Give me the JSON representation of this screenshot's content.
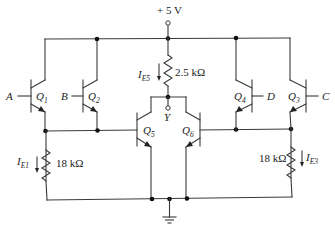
{
  "figure": {
    "type": "circuit-schematic",
    "supply": {
      "label": "+ 5 V"
    },
    "resistors": [
      {
        "id": "R_E5",
        "value": "2.5 kΩ",
        "current_label": "I",
        "current_sub": "E5"
      },
      {
        "id": "R_E1",
        "value": "18 kΩ",
        "current_label": "I",
        "current_sub": "E1"
      },
      {
        "id": "R_E3",
        "value": "18 kΩ",
        "current_label": "I",
        "current_sub": "E3"
      }
    ],
    "transistors": [
      {
        "id": "Q1",
        "name": "Q",
        "sub": "1",
        "input": "A"
      },
      {
        "id": "Q2",
        "name": "Q",
        "sub": "2",
        "input": "B"
      },
      {
        "id": "Q3",
        "name": "Q",
        "sub": "3",
        "input": "C"
      },
      {
        "id": "Q4",
        "name": "Q",
        "sub": "4",
        "input": "D"
      },
      {
        "id": "Q5",
        "name": "Q",
        "sub": "5"
      },
      {
        "id": "Q6",
        "name": "Q",
        "sub": "6"
      }
    ],
    "output": {
      "label": "Y"
    },
    "ground": {
      "symbol": "ground-icon"
    }
  }
}
